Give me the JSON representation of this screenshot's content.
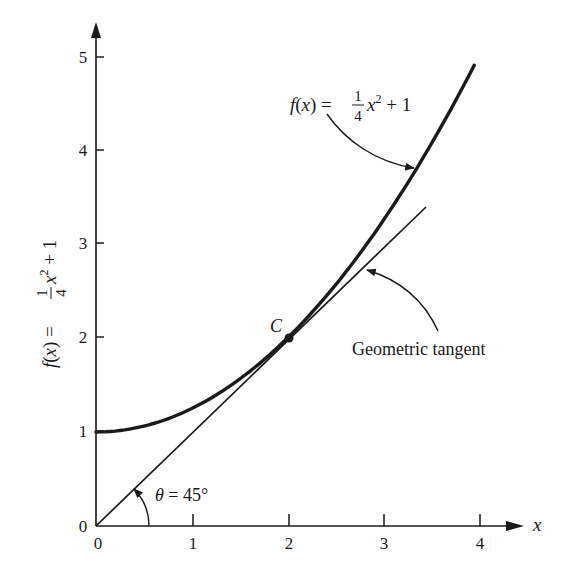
{
  "chart_data": {
    "type": "line",
    "title": "",
    "xlabel": "x",
    "ylabel": "f(x) = 1/4 x^2 + 1",
    "xlim": [
      0,
      4.2
    ],
    "ylim": [
      0,
      5.2
    ],
    "grid": false,
    "x_ticks": [
      "0",
      "1",
      "2",
      "3",
      "4"
    ],
    "y_ticks": [
      "0",
      "1",
      "2",
      "3",
      "4",
      "5"
    ],
    "series": [
      {
        "name": "f(x) = 1/4 x^2 + 1",
        "style": "thick curve",
        "x": [
          0,
          0.5,
          1,
          1.5,
          2,
          2.5,
          3,
          3.5,
          3.97
        ],
        "y": [
          1,
          1.0625,
          1.25,
          1.5625,
          2,
          2.5625,
          3.25,
          4.0625,
          4.94
        ]
      },
      {
        "name": "Geometric tangent",
        "style": "thin line",
        "x": [
          0,
          3.42
        ],
        "y": [
          0,
          3.42
        ]
      }
    ],
    "points": [
      {
        "label": "C",
        "x": 2,
        "y": 2
      }
    ],
    "annotations": [
      {
        "text": "f(x) = 1/4 x^2 + 1",
        "points_to": "curve",
        "at_x": 3.3
      },
      {
        "text": "Geometric tangent",
        "points_to": "tangent line",
        "at_x": 2.85
      },
      {
        "text": "θ = 45°",
        "describes": "angle between tangent and x-axis"
      }
    ]
  },
  "labels": {
    "y_axis_title_prefix": "f(x) =",
    "frac_num": "1",
    "frac_den": "4",
    "x_var": "x",
    "sq": "2",
    "plus_one": "+ 1",
    "x_axis_label": "x",
    "point_c": "C",
    "curve_label_prefix": "f(x) =",
    "tangent_label": "Geometric tangent",
    "theta_label": "θ = 45°",
    "origin_y": "0",
    "x_ticks": [
      "0",
      "1",
      "2",
      "3",
      "4"
    ],
    "y_ticks": [
      "1",
      "2",
      "3",
      "4",
      "5"
    ]
  }
}
